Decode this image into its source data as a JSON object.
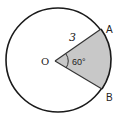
{
  "diagram": {
    "type": "circle-sector",
    "center_label": "O",
    "point_a_label": "A",
    "point_b_label": "B",
    "radius_label": "3",
    "angle_label": "60°",
    "sector_fill": "#c8c8c8",
    "stroke_color": "#1a1a1a"
  }
}
